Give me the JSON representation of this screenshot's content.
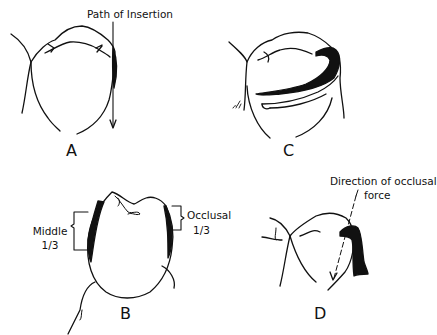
{
  "figure": {
    "panels": [
      {
        "id": "A",
        "letter": "A",
        "annotations": [
          "Path of Insertion"
        ]
      },
      {
        "id": "B",
        "letter": "B",
        "annotations": [
          "Middle",
          "1/3",
          "Occlusal",
          "1/3"
        ]
      },
      {
        "id": "C",
        "letter": "C",
        "annotations": []
      },
      {
        "id": "D",
        "letter": "D",
        "annotations": [
          "Direction of occlusal",
          "force"
        ]
      }
    ],
    "labels": {
      "a_letter": "A",
      "b_letter": "B",
      "c_letter": "C",
      "d_letter": "D",
      "path_of_insertion": "Path of Insertion",
      "middle": "Middle",
      "middle_fraction": "1/3",
      "occlusal": "Occlusal",
      "occlusal_fraction": "1/3",
      "direction_line1": "Direction of occlusal",
      "direction_line2": "force"
    },
    "colors": {
      "ink": "#111111",
      "background": "#ffffff"
    }
  }
}
